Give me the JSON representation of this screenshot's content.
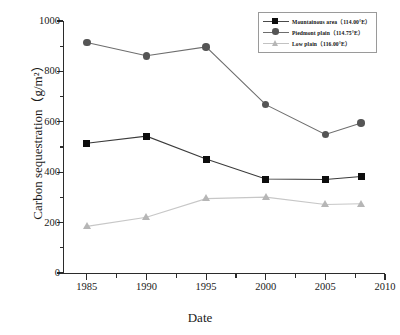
{
  "chart_data": {
    "type": "line",
    "title": "",
    "xlabel": "Date",
    "ylabel": "Carbon sequestration（g/m²）",
    "x": [
      1985,
      1990,
      1995,
      2000,
      2005,
      2008
    ],
    "xlim": [
      1983,
      2010
    ],
    "ylim": [
      0,
      1000
    ],
    "xticks": [
      1985,
      1990,
      1995,
      2000,
      2005,
      2010
    ],
    "xtick_labels": [
      "1985",
      "1990",
      "1995",
      "2000",
      "2005",
      "2010"
    ],
    "yticks": [
      0,
      200,
      400,
      600,
      800,
      1000
    ],
    "ytick_labels": [
      "0",
      "200",
      "400",
      "600",
      "800",
      "1000"
    ],
    "y_minor_ticks": [
      100,
      300,
      500,
      700,
      900
    ],
    "grid": false,
    "legend_position": "top-right",
    "series": [
      {
        "name": "Mountainous area（114.00°E）",
        "marker": "square",
        "color": "#0d0d0d",
        "values": [
          515,
          543,
          452,
          373,
          371,
          383
        ]
      },
      {
        "name": "Piedmont plain（114.75°E）",
        "marker": "circle",
        "color": "#555555",
        "values": [
          915,
          862,
          897,
          668,
          550,
          595
        ]
      },
      {
        "name": "Low plain（116.00°E）",
        "marker": "triangle",
        "color": "#b6b6b6",
        "values": [
          185,
          221,
          295,
          301,
          272,
          275
        ]
      }
    ]
  },
  "axis": {
    "y_title": "Carbon sequestration（g/m²）",
    "x_title": "Date"
  },
  "legend": {
    "items": [
      {
        "label": "Mountainous area（114.00°E）",
        "marker": "square-marker-icon"
      },
      {
        "label": "Piedmont plain（114.75°E）",
        "marker": "circle-marker-icon"
      },
      {
        "label": "Low plain（116.00°E）",
        "marker": "triangle-marker-icon"
      }
    ]
  }
}
